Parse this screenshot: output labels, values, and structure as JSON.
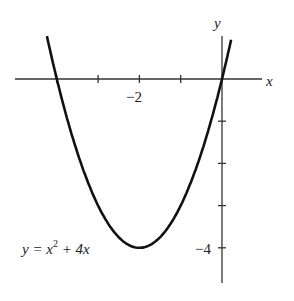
{
  "chart_data": {
    "type": "line",
    "title": "",
    "equation": "y = x^2 + 4x",
    "equation_parts": {
      "lhs": "y = x",
      "exp": "2",
      "rhs": " + 4x"
    },
    "xlabel": "x",
    "ylabel": "y",
    "x_tick_labels": [
      {
        "value": -2,
        "label": "−2"
      }
    ],
    "y_tick_labels": [
      {
        "value": -4,
        "label": "−4"
      }
    ],
    "x_ticks": [
      -4,
      -3,
      -2,
      -1,
      0
    ],
    "y_ticks": [
      0,
      -1,
      -2,
      -3,
      -4
    ],
    "xlim": [
      -5.0,
      1.2
    ],
    "ylim": [
      -5.0,
      1.4
    ],
    "grid": false,
    "series": [
      {
        "name": "y = x^2 + 4x",
        "x": [
          -4.24,
          -4,
          -3.5,
          -3,
          -2.5,
          -2,
          -1.5,
          -1,
          -0.5,
          0,
          0.22
        ],
        "y": [
          0.95,
          0,
          -1.75,
          -3,
          -3.75,
          -4,
          -3.75,
          -3,
          -1.75,
          0,
          0.93
        ]
      }
    ],
    "vertex": [
      -2,
      -4
    ],
    "roots": [
      -4,
      0
    ]
  }
}
